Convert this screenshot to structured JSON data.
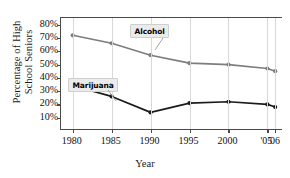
{
  "chart_data": {
    "type": "line",
    "title": "",
    "xlabel": "Year",
    "ylabel": "Percentage of High School Seniors",
    "x": [
      1980,
      1985,
      1990,
      1995,
      2000,
      2005,
      2006
    ],
    "categories": [
      "1980",
      "1985",
      "1990",
      "1995",
      "2000",
      "'05",
      "'06"
    ],
    "xlim": [
      1978.5,
      2007
    ],
    "ylim": [
      0,
      85
    ],
    "ytick_values": [
      10,
      20,
      30,
      40,
      50,
      60,
      70,
      80
    ],
    "ytick_labels": [
      "10%",
      "20%",
      "30%",
      "40%",
      "50%",
      "60%",
      "70%",
      "80%"
    ],
    "grid": "vertical",
    "legend": "inline-annotations",
    "series": [
      {
        "name": "Alcohol",
        "color": "#7d7d7d",
        "marker": "circle",
        "values": [
          72,
          66,
          57,
          51,
          50,
          47,
          45
        ]
      },
      {
        "name": "Marijuana",
        "color": "#1b1b1b",
        "marker": "circle",
        "values": [
          34,
          26,
          14,
          21,
          22,
          20,
          18
        ]
      }
    ],
    "annotations": [
      {
        "text": "Alcohol",
        "for_series": "Alcohol"
      },
      {
        "text": "Marijuana",
        "for_series": "Marijuana"
      }
    ]
  },
  "axes": {
    "y_title_line1": "Percentage of High",
    "y_title_line2": "School Seniors",
    "x_title": "Year"
  },
  "colors": {
    "alcohol_line": "#7d7d7d",
    "marijuana_line": "#1b1b1b",
    "axis": "#4a4a4a",
    "gridline": "#d8d8d8",
    "label_background": "#ebebeb",
    "background": "#ffffff"
  }
}
